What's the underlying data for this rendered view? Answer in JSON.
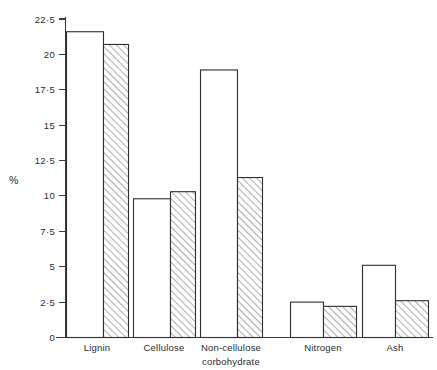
{
  "chart_data": {
    "type": "bar",
    "title": "",
    "xlabel": "",
    "ylabel": "%",
    "ylim": [
      0,
      22.5
    ],
    "grid": false,
    "legend": "none",
    "categories": [
      "Lignin",
      "Non-cellulose carbohydrate",
      "Cellulose",
      "Nitrogen",
      "Ash"
    ],
    "category_display": [
      {
        "line1": "Lignin",
        "line2": ""
      },
      {
        "line1": "Cellulose",
        "line2": ""
      },
      {
        "line1": "Non-cellulose",
        "line2": "corbohydrate"
      },
      {
        "line1": "Nitrogen",
        "line2": ""
      },
      {
        "line1": "Ash",
        "line2": ""
      }
    ],
    "series": [
      {
        "name": "open",
        "fill": "white",
        "values": [
          21.6,
          9.8,
          18.9,
          2.5,
          5.1
        ]
      },
      {
        "name": "hatched",
        "fill": "diagonal-hatch",
        "values": [
          20.7,
          10.3,
          11.3,
          2.2,
          2.6
        ]
      }
    ],
    "y_ticks": [
      0,
      2.5,
      5,
      7.5,
      10,
      12.5,
      15,
      17.5,
      20,
      22.5
    ],
    "y_tick_labels": [
      "0",
      "2·5",
      "5",
      "7·5",
      "10",
      "12·5",
      "15",
      "17·5",
      "20",
      "22·5"
    ]
  },
  "axis": {
    "y_title": "%"
  }
}
